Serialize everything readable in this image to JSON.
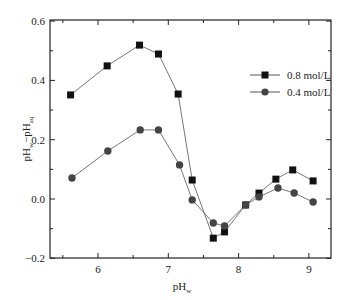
{
  "chart_data": {
    "type": "line",
    "title": "",
    "xlabel": "pH_w",
    "ylabel": "pH_w−pH_aq",
    "xlim": [
      5.3,
      9.3
    ],
    "ylim": [
      -0.2,
      0.6
    ],
    "xticks": [
      "6",
      "7",
      "8",
      "9"
    ],
    "yticks": [
      "-0.2",
      "0.0",
      "0.2",
      "0.4",
      "0.6"
    ],
    "grid": false,
    "legend_position": "upper right",
    "series": [
      {
        "name": "0.8 mol/L",
        "marker": "square",
        "color": "#111111",
        "x": [
          5.61,
          6.13,
          6.59,
          6.86,
          7.14,
          7.34,
          7.64,
          7.8,
          8.1,
          8.29,
          8.53,
          8.77,
          9.06
        ],
        "y": [
          0.351,
          0.449,
          0.519,
          0.489,
          0.354,
          0.064,
          -0.132,
          -0.111,
          -0.02,
          0.02,
          0.067,
          0.098,
          0.061
        ]
      },
      {
        "name": "0.4 mol/L",
        "marker": "circle",
        "color": "#444444",
        "x": [
          5.63,
          6.14,
          6.6,
          6.86,
          7.16,
          7.34,
          7.64,
          7.8,
          8.1,
          8.29,
          8.56,
          8.79,
          9.06
        ],
        "y": [
          0.071,
          0.162,
          0.233,
          0.233,
          0.115,
          -0.003,
          -0.081,
          -0.091,
          -0.02,
          0.007,
          0.037,
          0.02,
          -0.01
        ]
      }
    ]
  },
  "labels": {
    "ylabel_main": "pH",
    "ylabel_sub1": "w",
    "ylabel_dash": "−pH",
    "ylabel_sub2": "aq",
    "xlabel_main": "pH",
    "xlabel_sub": "w",
    "legend_0": "0.8 mol/L",
    "legend_1": "0.4 mol/L"
  }
}
